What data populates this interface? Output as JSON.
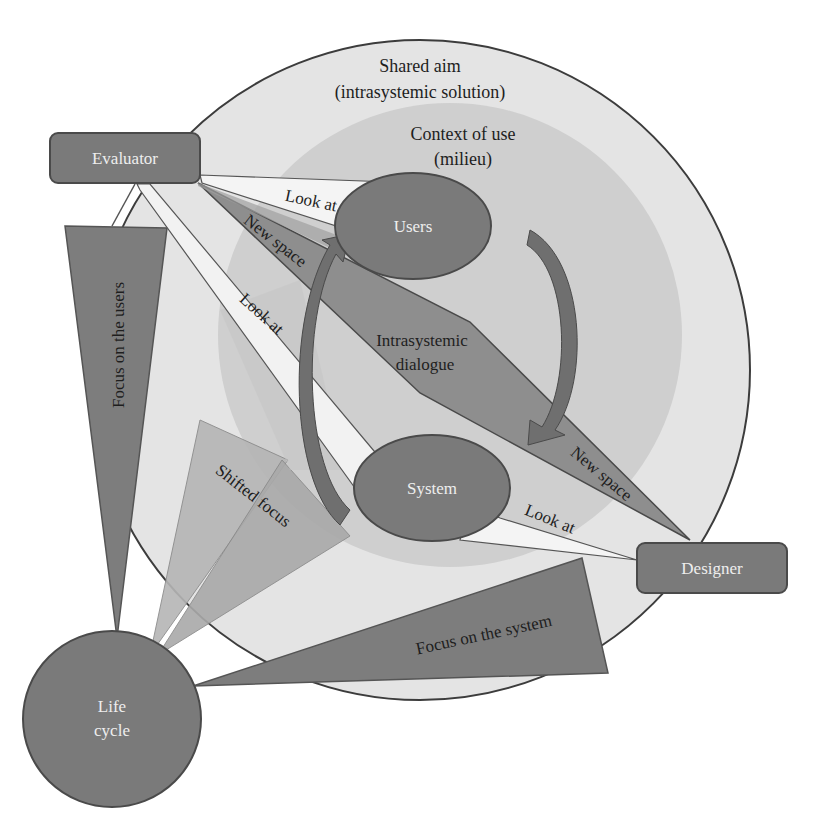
{
  "diagram": {
    "outer_circle": {
      "label_line1": "Shared aim",
      "label_line2": "(intrasystemic solution)"
    },
    "inner_circle": {
      "label_line1": "Context of use",
      "label_line2": "(milieu)"
    },
    "nodes": {
      "evaluator": "Evaluator",
      "designer": "Designer",
      "users": "Users",
      "system": "System",
      "life_cycle_line1": "Life",
      "life_cycle_line2": "cycle"
    },
    "center": {
      "line1": "Intrasystemic",
      "line2": "dialogue"
    },
    "beams": {
      "look_at_evaluator_users": "Look at",
      "look_at_evaluator_system": "Look at",
      "look_at_designer_system": "Look at",
      "new_space_evaluator": "New space",
      "new_space_designer": "New space"
    },
    "focus": {
      "users": "Focus on the users",
      "system": "Focus on the system",
      "shifted": "Shifted focus"
    }
  },
  "colors": {
    "background": "#ffffff",
    "outer_fill": "#e4e4e4",
    "inner_fill": "#cfcfcf",
    "node_fill": "#7a7a7a",
    "node_stroke": "#4a4a4a",
    "beam_light": "#f2f2f2",
    "beam_dark": "#8e8e8e",
    "focus_dark": "#7d7d7d",
    "focus_light": "#a9a9a9",
    "arrow": "#6f6f6f",
    "text_dark": "#1e1e1e",
    "text_light": "#eeeeee"
  }
}
